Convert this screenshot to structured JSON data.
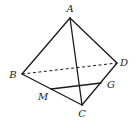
{
  "diagram": {
    "type": "tetrahedron",
    "vertices": {
      "A": {
        "label": "A",
        "x": 70,
        "y": 18,
        "lx": 70,
        "ly": 12
      },
      "B": {
        "label": "B",
        "x": 22,
        "y": 74,
        "lx": 13,
        "ly": 78
      },
      "C": {
        "label": "C",
        "x": 82,
        "y": 105,
        "lx": 82,
        "ly": 117
      },
      "D": {
        "label": "D",
        "x": 117,
        "y": 63,
        "lx": 124,
        "ly": 66
      },
      "M": {
        "label": "M",
        "x": 51,
        "y": 89,
        "lx": 43,
        "ly": 100
      },
      "G": {
        "label": "G",
        "x": 101,
        "y": 83,
        "lx": 111,
        "ly": 88
      }
    },
    "edges_solid": [
      "AB",
      "AD",
      "AC",
      "BC",
      "CD",
      "MG"
    ],
    "edges_dashed": [
      "BD"
    ]
  }
}
